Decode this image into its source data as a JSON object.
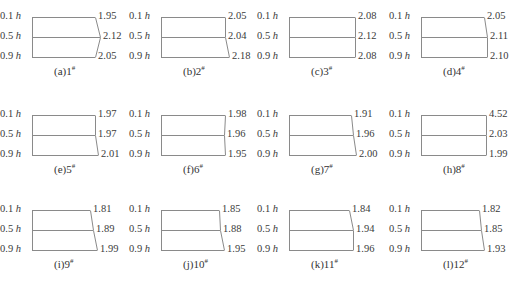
{
  "chart_data": {
    "type": "diagram",
    "height_labels": [
      "0.1 h",
      "0.5 h",
      "0.9 h"
    ],
    "panels": [
      {
        "id": "a",
        "caption": "(a)1",
        "sup": "#",
        "values": [
          "1.95",
          "2.12",
          "2.05"
        ]
      },
      {
        "id": "b",
        "caption": "(b)2",
        "sup": "#",
        "values": [
          "2.05",
          "2.04",
          "2.18"
        ]
      },
      {
        "id": "c",
        "caption": "(c)3",
        "sup": "#",
        "values": [
          "2.08",
          "2.12",
          "2.08"
        ]
      },
      {
        "id": "d",
        "caption": "(d)4",
        "sup": "#",
        "values": [
          "2.05",
          "2.11",
          "2.10"
        ]
      },
      {
        "id": "e",
        "caption": "(e)5",
        "sup": "#",
        "values": [
          "1.97",
          "1.97",
          "2.01"
        ]
      },
      {
        "id": "f",
        "caption": "(f)6",
        "sup": "#",
        "values": [
          "1.98",
          "1.96",
          "1.95"
        ]
      },
      {
        "id": "g",
        "caption": "(g)7",
        "sup": "#",
        "values": [
          "1.91",
          "1.96",
          "2.00"
        ]
      },
      {
        "id": "h",
        "caption": "(h)8",
        "sup": "#",
        "values": [
          "4.52",
          "2.03",
          "1.99"
        ]
      },
      {
        "id": "i",
        "caption": "(i)9",
        "sup": "#",
        "values": [
          "1.81",
          "1.89",
          "1.99"
        ]
      },
      {
        "id": "j",
        "caption": "(j)10",
        "sup": "#",
        "values": [
          "1.85",
          "1.88",
          "1.95"
        ]
      },
      {
        "id": "k",
        "caption": "(k)11",
        "sup": "#",
        "values": [
          "1.84",
          "1.94",
          "1.96"
        ]
      },
      {
        "id": "l",
        "caption": "(l)12",
        "sup": "#",
        "values": [
          "1.82",
          "1.85",
          "1.93"
        ]
      }
    ],
    "line_color": "#8a8a8a"
  }
}
